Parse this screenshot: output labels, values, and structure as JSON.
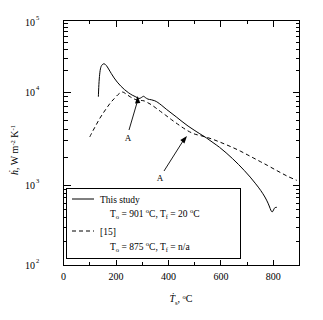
{
  "chart_data": {
    "type": "line",
    "title": "",
    "xlabel": "Ṫs, °C",
    "xlabel_main": "T",
    "xlabel_sub": "s",
    "xlabel_rest": ",  °C",
    "ylabel": "ḣ, W m⁻² K⁻¹",
    "ylabel_main": "h",
    "ylabel_rest": ",  W m",
    "ylabel_exp1": "-2",
    "ylabel_mid": " K",
    "ylabel_exp2": "-1",
    "xscale": "linear",
    "yscale": "log",
    "xlim": [
      0,
      900
    ],
    "ylim": [
      100,
      100000
    ],
    "xticks": [
      0,
      200,
      400,
      600,
      800
    ],
    "xticklabels": [
      "0",
      "200",
      "400",
      "600",
      "800"
    ],
    "yticks": [
      100,
      1000,
      10000,
      100000
    ],
    "yticklabels": [
      "10",
      "10",
      "10",
      "10"
    ],
    "ytickexps": [
      "2",
      "3",
      "4",
      "5"
    ],
    "grid": false,
    "legend_position": "lower-left-inside",
    "series": [
      {
        "name": "This study",
        "style": "solid",
        "label_line1": "This study",
        "label_T0_prefix": "T",
        "label_T0_sub": "o",
        "label_T0_value": " =  901 ",
        "label_T0_unit": "C,",
        "label_Tf_prefix": "T",
        "label_Tf_sub": "f",
        "label_Tf_value": " =  20 ",
        "label_Tf_unit": "C",
        "T0": 901,
        "Tf": 20,
        "points": [
          [
            133,
            11800
          ],
          [
            135,
            16500
          ],
          [
            138,
            22000
          ],
          [
            142,
            26500
          ],
          [
            148,
            28800
          ],
          [
            155,
            29500
          ],
          [
            163,
            28200
          ],
          [
            172,
            25500
          ],
          [
            182,
            22500
          ],
          [
            193,
            19800
          ],
          [
            205,
            17600
          ],
          [
            218,
            15800
          ],
          [
            232,
            14300
          ],
          [
            247,
            13100
          ],
          [
            262,
            12200
          ],
          [
            276,
            11600
          ],
          [
            288,
            11100
          ],
          [
            297,
            11400
          ],
          [
            305,
            11800
          ],
          [
            312,
            11400
          ],
          [
            322,
            10900
          ],
          [
            335,
            10700
          ],
          [
            348,
            10400
          ],
          [
            360,
            9900
          ],
          [
            375,
            9100
          ],
          [
            392,
            8200
          ],
          [
            410,
            7400
          ],
          [
            430,
            6600
          ],
          [
            452,
            5800
          ],
          [
            475,
            5100
          ],
          [
            498,
            4550
          ],
          [
            520,
            4100
          ],
          [
            545,
            3650
          ],
          [
            570,
            3200
          ],
          [
            595,
            2800
          ],
          [
            620,
            2400
          ],
          [
            645,
            2030
          ],
          [
            668,
            1720
          ],
          [
            690,
            1450
          ],
          [
            712,
            1210
          ],
          [
            733,
            1000
          ],
          [
            752,
            830
          ],
          [
            768,
            690
          ],
          [
            780,
            580
          ],
          [
            788,
            500
          ],
          [
            793,
            460
          ],
          [
            797,
            455
          ],
          [
            801,
            480
          ],
          [
            806,
            510
          ],
          [
            812,
            515
          ]
        ]
      },
      {
        "name": "[15]",
        "style": "dashed",
        "label_line1": "[15]",
        "label_T0_prefix": "T",
        "label_T0_sub": "o",
        "label_T0_value": " =  875 ",
        "label_T0_unit": "C,",
        "label_Tf_prefix": "T",
        "label_Tf_sub": "f",
        "label_Tf_value": " =  n/a",
        "label_Tf_unit": "",
        "T0": 875,
        "Tf": "n/a",
        "points": [
          [
            100,
            3750
          ],
          [
            112,
            4450
          ],
          [
            125,
            5300
          ],
          [
            138,
            6300
          ],
          [
            152,
            7400
          ],
          [
            166,
            8600
          ],
          [
            180,
            9900
          ],
          [
            194,
            11100
          ],
          [
            207,
            12300
          ],
          [
            218,
            13100
          ],
          [
            226,
            13300
          ],
          [
            234,
            12900
          ],
          [
            243,
            12300
          ],
          [
            255,
            11600
          ],
          [
            268,
            11000
          ],
          [
            282,
            10600
          ],
          [
            296,
            10500
          ],
          [
            308,
            10350
          ],
          [
            320,
            9900
          ],
          [
            335,
            9300
          ],
          [
            352,
            8500
          ],
          [
            370,
            7700
          ],
          [
            390,
            6900
          ],
          [
            412,
            6100
          ],
          [
            435,
            5400
          ],
          [
            458,
            4800
          ],
          [
            480,
            4350
          ],
          [
            502,
            4050
          ],
          [
            522,
            3900
          ],
          [
            545,
            3720
          ],
          [
            570,
            3500
          ],
          [
            596,
            3250
          ],
          [
            622,
            3000
          ],
          [
            648,
            2760
          ],
          [
            674,
            2520
          ],
          [
            700,
            2280
          ],
          [
            726,
            2060
          ],
          [
            752,
            1860
          ],
          [
            778,
            1680
          ],
          [
            804,
            1510
          ],
          [
            830,
            1360
          ],
          [
            856,
            1230
          ],
          [
            882,
            1130
          ],
          [
            890,
            1100
          ]
        ]
      }
    ],
    "annotations": [
      {
        "label": "A",
        "text_x": 127,
        "text_y": 138,
        "tip_x": 137,
        "tip_y": 97
      },
      {
        "label": "A",
        "text_x": 159,
        "text_y": 177,
        "tip_x": 187,
        "tip_y": 136
      }
    ]
  }
}
